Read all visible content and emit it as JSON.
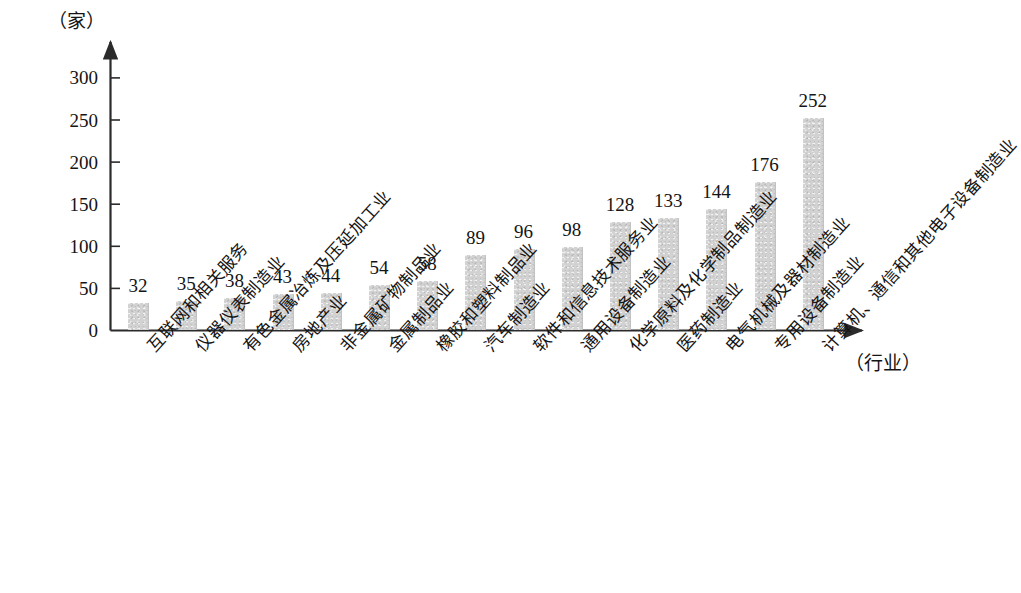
{
  "chart_data": {
    "type": "bar",
    "title": "",
    "subtitle": "",
    "xlabel": "（行业）",
    "ylabel": "（家）",
    "ylim": [
      0,
      320
    ],
    "grid": false,
    "legend": null,
    "y_ticks": [
      0,
      50,
      100,
      150,
      200,
      250,
      300
    ],
    "y_tick_labels": [
      "0",
      "50",
      "100",
      "150",
      "200",
      "250",
      "300"
    ],
    "categories": [
      "互联网和相关服务",
      "仪器仪表制造业",
      "有色金属冶炼及压延加工业",
      "房地产业",
      "非金属矿物制品业",
      "金属制品业",
      "橡胶和塑料制品业",
      "汽车制造业",
      "软件和信息技术服务业",
      "通用设备制造业",
      "化学原料及化学制品制造业",
      "医药制造业",
      "电气机械及器材制造业",
      "专用设备制造业",
      "计算机、通信和其他电子设备制造业"
    ],
    "values": [
      32,
      35,
      38,
      43,
      44,
      54,
      58,
      89,
      96,
      98,
      128,
      133,
      144,
      176,
      252
    ],
    "value_labels": [
      "32",
      "35",
      "38",
      "43",
      "44",
      "54",
      "58",
      "89",
      "96",
      "98",
      "128",
      "133",
      "144",
      "176",
      "252"
    ],
    "bar_color": "#d2d2d2",
    "axis_color": "#2b2b2b"
  }
}
